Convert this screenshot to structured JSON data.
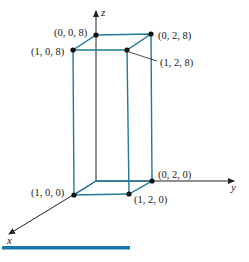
{
  "diagram": {
    "type": "3d-rectangular-box",
    "axes": {
      "x_label": "x",
      "y_label": "y",
      "z_label": "z"
    },
    "vertices": [
      {
        "id": "p008",
        "label": "(0, 0, 8)"
      },
      {
        "id": "p028",
        "label": "(0, 2, 8)"
      },
      {
        "id": "p108",
        "label": "(1, 0, 8)"
      },
      {
        "id": "p128",
        "label": "(1, 2, 8)"
      },
      {
        "id": "p100",
        "label": "(1, 0, 0)"
      },
      {
        "id": "p120",
        "label": "(1, 2, 0)"
      },
      {
        "id": "p020",
        "label": "(0, 2, 0)"
      }
    ],
    "colors": {
      "box_edges": "#1f7a9c",
      "axes": "#222222",
      "points": "#111111",
      "bottom_bar": "#1a78a8"
    }
  }
}
